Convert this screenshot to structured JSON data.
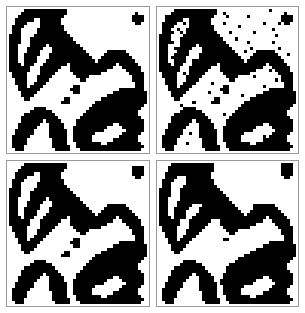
{
  "figure": {
    "layout": "2x2-grid",
    "background_color": "#ffffff",
    "foreground_color": "#000000",
    "border_color": "#9a9a9a",
    "grid_size": 45,
    "panel_count": 4
  },
  "panels": [
    {
      "id": "panel-top-left",
      "position": "top-left",
      "caption": "",
      "role": "true-scene",
      "grid_width": 45,
      "grid_height": 45,
      "rows": [
        "000001111111111111100000000000000000000000000",
        "000011111111111111100000000000000000000001000",
        "000111111111111111000000000000000000000011110",
        "001111110011111110000000000000000000000011110",
        "001111000011111110000000000000000000000001100",
        "011110000011111111000000000000000000000000000",
        "011100000111111111000000000000000000000000000",
        "011100000111111111100000000000000000000000000",
        "111100001111111111110000000000000000000000000",
        "111100011111111111111000000000000000000000000",
        "111100011111111111111100000000000000000000000",
        "111000011111011111111110000000000000000000000",
        "111000111110001111111111000000000000000000000",
        "111000111100001111111111100000001111110000000",
        "111001111100011111111111110000011111111000000",
        "111001111000011111111111111000111111111100000",
        "111001111000111111111111111101111111111110000",
        "111101110001111111101111111111111110111111000",
        "111111100011111110001111111111111100011111100",
        "111111100011111100001111111111110000001111100",
        "011111000011111000000111111111000000000111110",
        "011111000111110000000011110000000000000011110",
        "001111000111100000000001100000000000000011110",
        "001111001111000000000000000000000000000001110",
        "000111011110000000000110000000000000000001110",
        "000111111100000000001110000000000000111111110",
        "000011111000000000000110000000000011111111111",
        "000011110000000000000000000000001111111111111",
        "000001100000000000110000000000111111111111111",
        "000000000000000001110000000011111111111111111",
        "000000000000000000000000000111111111111111110",
        "000000001111000000000000001111111111111111100",
        "000000011111110000000000011111111111111111000",
        "000001111111111000000000111111111111111111000",
        "000011111111111100000001111111111111111111100",
        "000011111110111110000011111111111111111111110",
        "000111111100011111000011111111111100111111110",
        "000111111000011111000111111111110000011111110",
        "001111110000011111100111111111100000001111110",
        "001111110000011111100111111100000000011111100",
        "011111100000011111100111111000000000111111000",
        "011111000000001111100111111000000011111111000",
        "011111000000001111100011111111001111111111100",
        "011110000000001111110011111111111111111111110",
        "001110000000000111110001111111111111111111100"
      ]
    },
    {
      "id": "panel-top-right",
      "position": "top-right",
      "caption": "",
      "role": "noisy-observation",
      "grid_width": 45,
      "grid_height": 45,
      "rows": [
        "000001111111111111100000000000000000100000000",
        "000011111111111111100100000000000000000001000",
        "001111111111111111000010000001000000000011110",
        "001111110011111110000000000000000000000011110",
        "011111001011111110000100000000000010000101100",
        "011110000011111111000000001000000000000000000",
        "011100100111111111000000000000000000010000000",
        "011110010111111111100001000000010000000000000",
        "111100001111111111110000000000000000001000000",
        "111100011111111111111000010000000000000000000",
        "111110011111111111111100000001000000010000000",
        "111000011111011111111110000000000000000000000",
        "111001111110001111111111000000100000000100000",
        "111000111100001111111111100010001111110000000",
        "111001111100011111111111110000011111111000100",
        "111011111000011111111111111000111111111100000",
        "111001111001111111111111111101111111111110000",
        "111101110001111111101111111111111110111111000",
        "111111100011111110001111111111111100011111100",
        "111111100011111100001111111111110000101111100",
        "011111001011111000000111111111000000000111110",
        "011111000111110000000011110000010000000011110",
        "001111000111100000000001100000000000001011110",
        "001111001111000001000000000000000000000001110",
        "000111011110000000000110000000000010000001110",
        "000111111100000000001110000000000000111111110",
        "000011111000000010000110000000000011111111111",
        "000011110000000000000000000100001111111111111",
        "000001100000000000110000000000111111111111111",
        "000000000001000001110000000011111111111111111",
        "000000010000000000000000000111111111111111110",
        "000000001111000000000000001111111111111111100",
        "000000011111110000000000011111111111111111000",
        "000001111111111000000100111111111111111111000",
        "000011111111111100000001111111111111111111100",
        "000011111110111110000011111111111111111111110",
        "000111111100011111000011111111111100111111110",
        "000111111000011111000111111111110000011111110",
        "001111110000011111100111111111100000001111110",
        "001111110010011111100111111100000000011111100",
        "011111100000011111100111111000000010111111000",
        "011111000000001111100111111000000011111111000",
        "011111000100001111100011111111001111111111100",
        "011110000000001111110011111111111111111111110",
        "001110000000000111110001111111111111111111100"
      ]
    },
    {
      "id": "panel-bottom-left",
      "position": "bottom-left",
      "caption": "",
      "role": "restored-estimate-a",
      "grid_width": 45,
      "grid_height": 45,
      "rows": [
        "000001111111111111100000000000000000000000000",
        "000011111111111111100000000000000000000011110",
        "000111111111111111000000000000000000000011110",
        "001111110011111110000000000000000000000011110",
        "001111000011111110000000000000000000000001100",
        "011110000011111111000000000000000000000000000",
        "011100000111111111000000000000000000000000000",
        "011100000111111111100000000000000000000000000",
        "111100001111111111110000000000000000000000000",
        "111100011111111111111000000000000000000000000",
        "111100011111111111111100000000000000000000000",
        "111000011111011111111110000000000000000000000",
        "111000111110001111111111000000000000000000000",
        "111000111100001111111111100000001111110000000",
        "111001111100011111111111110000011111111000000",
        "111001111000011111111111111000111111111100000",
        "111001111000111111111111111101111111111110000",
        "111101110001111111101111111111111110111111000",
        "111111100011111110001111111111111100011111100",
        "111111100011111100001111111111110000001111100",
        "011111000011111000000111111111000000000111110",
        "011111000111110000000011110000000000000011110",
        "001111000111100000000001100000000000000011110",
        "001111001111000000000000000000000000000001110",
        "000111011110000000000110000000000000000001110",
        "000111111100000000001110000000000000111111110",
        "000011111000000000000110000000000011111111111",
        "000011110000000000000000000000001111111111111",
        "000001100000000000110000000000111111111111111",
        "000000000000000001110000000011111111111111111",
        "000000000000000000000000000111111111111111110",
        "000000001111000000000000001111111111111111100",
        "000000011111110000000000011111111111111111000",
        "000001111111111000000000111111111111111111000",
        "000011111111111100000001111111111111111111100",
        "000011111110111110000011111111111111111111110",
        "000111111100011111000011111111111100111111110",
        "000111111000011111000111111111110000011111110",
        "001111110000011111100111111111100000001111110",
        "001111110000011111100111111100000000011111100",
        "011111100000011111100111111000000000111111000",
        "011111000000001111100111111000000011111111000",
        "011111000000001111100011111111001111111111100",
        "011110000000001111110011111111111111111111110",
        "001110000000000111110001111111111111111111100"
      ]
    },
    {
      "id": "panel-bottom-right",
      "position": "bottom-right",
      "caption": "",
      "role": "restored-estimate-b",
      "grid_width": 45,
      "grid_height": 45,
      "rows": [
        "000011111111111111000000000000000000000011110",
        "000111111111111111000000000000000000000011110",
        "000111111111111111000000000000000000000011110",
        "001111111111111110000000000000000000000011110",
        "001111000111111110000000000000000000000001100",
        "011110000111111111000000000000000000000000000",
        "011100000111111111000000000000000000000000000",
        "011100001111111111100000000000000000000000000",
        "111100011111111111110000000000000000000000000",
        "111100011111111111111000000000000000000000000",
        "111100011111111111111100000000000000000000000",
        "111000011111111111111110000000000000000000000",
        "111000111111111111111111000000000000000000000",
        "111000111110001111111111100000011111110000000",
        "111001111100011111111111110000011111111000000",
        "111001111000011111111111111000111111111100000",
        "111001111000111111111111111101111111111110000",
        "111101111001111111111111111111111110111111000",
        "111111100011111110001111111111111100011111100",
        "111111100011111100001111111111110000001111100",
        "011111000011111000000111111111000000000111110",
        "011111000111110000000011110000000000000011110",
        "001111000111100000000001100000000000000011110",
        "001111001111000000000000000000000000000001110",
        "000111011110000000000110000000000000000001110",
        "000111111100000000000000000000000000111111110",
        "000011111000000000000000000000000011111111111",
        "000011110000000000000000000000001111111111111",
        "000001100000000000000000000000111111111111111",
        "000000000000000000000000000011111111111111111",
        "000000000000000000000000001111111111111111110",
        "000000001111000000000000011111111111111111100",
        "000000011111110000000001111111111111111111000",
        "000001111111111000000011111111111111111111000",
        "000011111111111100000011111111111111111111100",
        "000011111110111110000111111111111111111111110",
        "000111111100011111000111111111111100111111110",
        "000111111000011111001111111111110000011111110",
        "001111110000011111101111111111100000001111110",
        "001111110000011111100111111100000000011111100",
        "011111100000011111100111111000000000111111000",
        "011111000000001111100111111000000011111111000",
        "011111000000001111100011111111001111111111100",
        "011110000000001111110011111111111111111111110",
        "001110000000000111110001111111111111111111100"
      ]
    }
  ]
}
